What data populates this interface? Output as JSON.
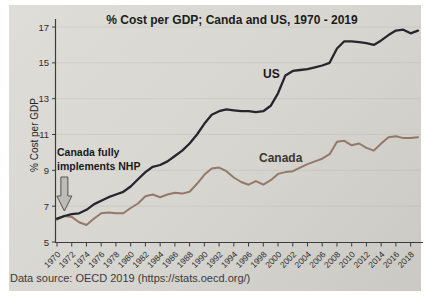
{
  "page": {
    "data_source": "Data source: OECD 2019 (https://stats.oecd.org/)"
  },
  "chart_data": {
    "type": "line",
    "title": "% Cost per GDP; Canda and US, 1970 - 2019",
    "xlabel": "",
    "ylabel": "% Cost per GDP",
    "ylim": [
      5,
      17
    ],
    "ytick_values": [
      5,
      7,
      9,
      11,
      13,
      15,
      17
    ],
    "xtick_years": [
      1970,
      1972,
      1974,
      1976,
      1978,
      1980,
      1982,
      1984,
      1986,
      1988,
      1990,
      1992,
      1994,
      1996,
      1998,
      2000,
      2002,
      2004,
      2006,
      2008,
      2010,
      2012,
      2014,
      2016,
      2018
    ],
    "x": [
      1970,
      1971,
      1972,
      1973,
      1974,
      1975,
      1976,
      1977,
      1978,
      1979,
      1980,
      1981,
      1982,
      1983,
      1984,
      1985,
      1986,
      1987,
      1988,
      1989,
      1990,
      1991,
      1992,
      1993,
      1994,
      1995,
      1996,
      1997,
      1998,
      1999,
      2000,
      2001,
      2002,
      2003,
      2004,
      2005,
      2006,
      2007,
      2008,
      2009,
      2010,
      2011,
      2012,
      2013,
      2014,
      2015,
      2016,
      2017,
      2018,
      2019
    ],
    "grid": "faint horizontal gridlines",
    "legend_position": "inline labels next to lines",
    "series": [
      {
        "name": "US",
        "color": "#26262e",
        "values": [
          6.3,
          6.45,
          6.55,
          6.6,
          6.8,
          7.1,
          7.3,
          7.5,
          7.65,
          7.8,
          8.1,
          8.5,
          8.9,
          9.2,
          9.3,
          9.5,
          9.8,
          10.1,
          10.5,
          11.0,
          11.6,
          12.1,
          12.3,
          12.4,
          12.35,
          12.3,
          12.3,
          12.25,
          12.3,
          12.6,
          13.3,
          14.3,
          14.55,
          14.6,
          14.65,
          14.75,
          14.85,
          15.0,
          15.8,
          16.2,
          16.2,
          16.15,
          16.1,
          16.0,
          16.25,
          16.55,
          16.8,
          16.85,
          16.65,
          16.8
        ]
      },
      {
        "name": "Canada",
        "color": "#94796a",
        "values": [
          6.25,
          6.45,
          6.4,
          6.1,
          5.95,
          6.3,
          6.6,
          6.65,
          6.6,
          6.6,
          6.9,
          7.15,
          7.55,
          7.65,
          7.5,
          7.65,
          7.75,
          7.7,
          7.8,
          8.25,
          8.75,
          9.1,
          9.15,
          8.95,
          8.6,
          8.35,
          8.2,
          8.4,
          8.2,
          8.45,
          8.8,
          8.9,
          8.95,
          9.15,
          9.35,
          9.5,
          9.65,
          9.9,
          10.6,
          10.65,
          10.4,
          10.5,
          10.25,
          10.1,
          10.5,
          10.85,
          10.9,
          10.8,
          10.8,
          10.85
        ]
      }
    ],
    "annotation": {
      "line1": "Canada fully",
      "line2": "implements NHP",
      "arrow": "gray block arrow pointing down",
      "points_to_year": 1971,
      "points_to_value": 6.5
    },
    "axis_color": "#3c3c3c",
    "arrow_fill": "#bdbcb7",
    "arrow_stroke": "#55544f"
  }
}
